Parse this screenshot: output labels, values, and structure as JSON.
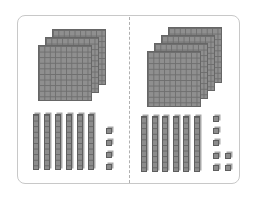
{
  "diagram": {
    "type": "base-ten-blocks",
    "panels": [
      {
        "name": "left",
        "hundreds": 3,
        "tens": 6,
        "ones": 4,
        "value": 364,
        "flats": [
          {
            "x": 52,
            "y": 29
          },
          {
            "x": 45,
            "y": 37
          },
          {
            "x": 38,
            "y": 45
          }
        ],
        "rods_x": [
          33,
          44,
          55,
          66,
          77,
          88
        ],
        "rods_y": 114,
        "units": [
          {
            "x": 106,
            "y": 128
          },
          {
            "x": 106,
            "y": 140
          },
          {
            "x": 106,
            "y": 152
          },
          {
            "x": 106,
            "y": 164
          }
        ]
      },
      {
        "name": "right",
        "hundreds": 4,
        "tens": 6,
        "ones": 7,
        "value": 467,
        "flats": [
          {
            "x": 168,
            "y": 27
          },
          {
            "x": 161,
            "y": 35
          },
          {
            "x": 154,
            "y": 43
          },
          {
            "x": 147,
            "y": 51
          }
        ],
        "rods_x": [
          141,
          152,
          162,
          173,
          183,
          194
        ],
        "rods_y": 116,
        "units": [
          {
            "x": 213,
            "y": 116
          },
          {
            "x": 213,
            "y": 128
          },
          {
            "x": 213,
            "y": 140
          },
          {
            "x": 213,
            "y": 153
          },
          {
            "x": 225,
            "y": 153
          },
          {
            "x": 213,
            "y": 165
          },
          {
            "x": 225,
            "y": 165
          }
        ]
      }
    ],
    "colors": {
      "block": "#8f8f8f",
      "grid": "#6e6e6e",
      "frame": "#c8c8c8",
      "divider": "#b0b0b0"
    }
  }
}
